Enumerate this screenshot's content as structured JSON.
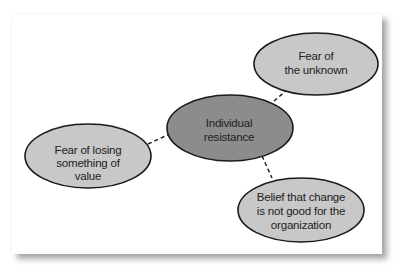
{
  "diagram": {
    "center": {
      "label_lines": [
        "Individual",
        "resistance"
      ],
      "fill": "#8c8c8c"
    },
    "nodes": [
      {
        "id": "fear-unknown",
        "label_lines": [
          "Fear of",
          "the unknown"
        ],
        "fill": "#c8c8c8"
      },
      {
        "id": "fear-losing-value",
        "label_lines": [
          "Fear of losing",
          "something of",
          "value"
        ],
        "fill": "#c8c8c8"
      },
      {
        "id": "belief-change-not-good",
        "label_lines": [
          "Belief that change",
          "is not good for the",
          "organization"
        ],
        "fill": "#c8c8c8"
      }
    ],
    "connector_style": "dashed",
    "stroke": "#1a1a1a"
  }
}
